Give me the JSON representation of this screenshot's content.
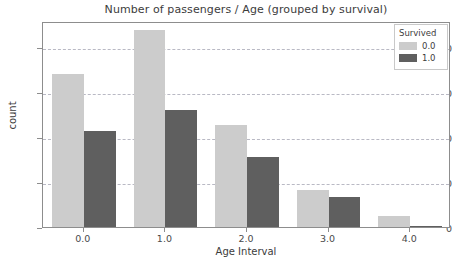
{
  "chart_data": {
    "type": "bar",
    "title": "Number of passengers / Age (grouped by survival)",
    "xlabel": "Age Interval",
    "ylabel": "count",
    "categories": [
      "0.0",
      "1.0",
      "2.0",
      "3.0",
      "4.0"
    ],
    "series": [
      {
        "name": "0.0",
        "color": "#cccccc",
        "values": [
          170,
          219,
          113,
          41,
          12
        ]
      },
      {
        "name": "1.0",
        "color": "#5f5f5f",
        "values": [
          107,
          130,
          78,
          33,
          1
        ]
      }
    ],
    "legend": {
      "title": "Survived",
      "position": "upper-right",
      "entries": [
        {
          "label": "0.0",
          "color": "#cccccc"
        },
        {
          "label": "1.0",
          "color": "#5f5f5f"
        }
      ]
    },
    "yticks": [
      0,
      50,
      100,
      150,
      200
    ],
    "ytick_labels": [
      "0",
      "50",
      "100",
      "150",
      "200"
    ],
    "xtick_labels": [
      "0.0",
      "1.0",
      "2.0",
      "3.0",
      "4.0"
    ],
    "ylim": [
      0,
      229
    ],
    "xlim": [
      -0.5,
      4.5
    ],
    "grid": true,
    "grid_axis": "y",
    "grid_style": "dashed",
    "background": "#ffffff",
    "axes_edge_color": "#8d8d8d"
  }
}
